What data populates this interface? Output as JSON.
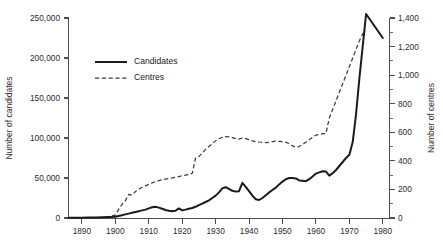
{
  "chart_data": {
    "type": "line",
    "title": "",
    "xlabel": "",
    "ylabel": "Number of candidates",
    "y2label": "Number of centres",
    "xlim": [
      1886,
      1982
    ],
    "ylim": [
      0,
      250000
    ],
    "y2lim": [
      0,
      1400
    ],
    "grid": false,
    "legend_position": "upper-left-inside",
    "x_ticks": [
      1890,
      1900,
      1910,
      1920,
      1930,
      1940,
      1950,
      1960,
      1970,
      1980
    ],
    "x_tick_labels": [
      "1890",
      "1900",
      "1910",
      "1920",
      "1930",
      "1940",
      "1950",
      "1960",
      "1970",
      "1980"
    ],
    "y_ticks": [
      0,
      50000,
      100000,
      150000,
      200000,
      250000
    ],
    "y_tick_labels": [
      "0",
      "50,000",
      "100,000",
      "150,000",
      "200,000",
      "250,000"
    ],
    "y2_ticks": [
      0,
      200,
      400,
      600,
      800,
      1000,
      1200,
      1400
    ],
    "y2_tick_labels": [
      "0",
      "200",
      "400",
      "600",
      "800",
      "1,000",
      "1,200",
      "1,400"
    ],
    "y2_minor_ticks": [
      100,
      300,
      500,
      700,
      900,
      1100,
      1300
    ],
    "series": [
      {
        "name": "Candidates",
        "axis": "left",
        "style": "solid",
        "color": "#1a1a1a",
        "x": [
          1886,
          1888,
          1890,
          1892,
          1894,
          1896,
          1898,
          1900,
          1901,
          1902,
          1903,
          1904,
          1905,
          1906,
          1907,
          1908,
          1909,
          1910,
          1911,
          1912,
          1913,
          1914,
          1915,
          1916,
          1917,
          1918,
          1919,
          1920,
          1921,
          1922,
          1923,
          1924,
          1925,
          1926,
          1927,
          1928,
          1929,
          1930,
          1931,
          1932,
          1933,
          1934,
          1935,
          1936,
          1937,
          1938,
          1939,
          1940,
          1941,
          1942,
          1943,
          1944,
          1945,
          1946,
          1947,
          1948,
          1949,
          1950,
          1951,
          1952,
          1953,
          1954,
          1955,
          1956,
          1957,
          1958,
          1959,
          1960,
          1961,
          1962,
          1963,
          1964,
          1965,
          1966,
          1967,
          1968,
          1969,
          1970,
          1971,
          1972,
          1973,
          1974,
          1975,
          1980
        ],
        "y": [
          200,
          300,
          400,
          500,
          700,
          900,
          1200,
          1500,
          2500,
          3500,
          4500,
          5500,
          6500,
          7500,
          8500,
          9500,
          10500,
          12000,
          13500,
          14000,
          13000,
          11500,
          10000,
          9000,
          8500,
          9000,
          12000,
          9500,
          10500,
          11500,
          12500,
          14000,
          16000,
          18000,
          20000,
          22000,
          25000,
          28000,
          32000,
          37000,
          38500,
          36500,
          34000,
          33000,
          33500,
          44000,
          39000,
          33500,
          28000,
          23500,
          22500,
          25000,
          28500,
          32000,
          35000,
          38000,
          42000,
          45500,
          48500,
          50000,
          50000,
          49500,
          47000,
          46500,
          46000,
          48500,
          52000,
          55500,
          57000,
          58500,
          58000,
          53000,
          56000,
          60000,
          65000,
          70000,
          75000,
          79000,
          95000,
          130000,
          175000,
          215000,
          255000,
          225000
        ]
      },
      {
        "name": "Centres",
        "axis": "right",
        "style": "dashed",
        "color": "#3d3d3d",
        "x": [
          1897,
          1898,
          1899,
          1900,
          1901,
          1902,
          1903,
          1904,
          1905,
          1906,
          1907,
          1908,
          1909,
          1910,
          1911,
          1912,
          1913,
          1914,
          1915,
          1916,
          1917,
          1918,
          1919,
          1920,
          1921,
          1922,
          1923,
          1924,
          1925,
          1926,
          1927,
          1928,
          1929,
          1930,
          1931,
          1932,
          1933,
          1934,
          1935,
          1936,
          1937,
          1938,
          1939,
          1940,
          1941,
          1942,
          1943,
          1944,
          1945,
          1946,
          1947,
          1948,
          1949,
          1950,
          1951,
          1952,
          1953,
          1954,
          1955,
          1956,
          1957,
          1958,
          1959,
          1960,
          1961,
          1962,
          1963,
          1964,
          1965,
          1966,
          1967,
          1968,
          1969,
          1970,
          1971,
          1972,
          1973,
          1974,
          1975
        ],
        "y": [
          5,
          10,
          15,
          20,
          60,
          95,
          120,
          165,
          160,
          185,
          200,
          215,
          225,
          235,
          245,
          255,
          262,
          268,
          272,
          276,
          280,
          285,
          290,
          295,
          300,
          305,
          312,
          420,
          430,
          455,
          480,
          500,
          520,
          540,
          555,
          565,
          570,
          568,
          562,
          555,
          552,
          560,
          556,
          548,
          540,
          535,
          532,
          530,
          528,
          530,
          535,
          538,
          536,
          534,
          530,
          520,
          505,
          495,
          500,
          515,
          530,
          548,
          565,
          580,
          585,
          590,
          592,
          700,
          760,
          820,
          880,
          940,
          1000,
          1060,
          1120,
          1180,
          1240,
          1290,
          1310
        ]
      }
    ],
    "legend": [
      {
        "label": "Candidates",
        "style": "solid"
      },
      {
        "label": "Centres",
        "style": "dashed"
      }
    ]
  }
}
